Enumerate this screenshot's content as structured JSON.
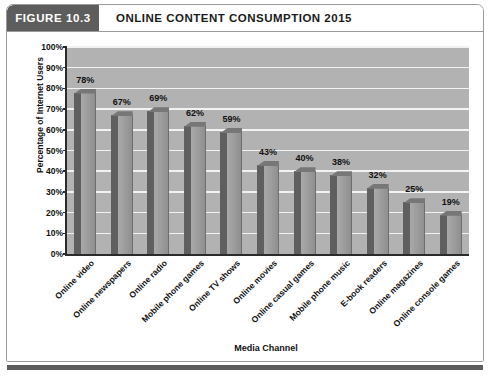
{
  "figure": {
    "badge": "FIGURE 10.3",
    "title": "ONLINE CONTENT CONSUMPTION 2015",
    "badge_color": "#5d5d5d",
    "frame_border_color": "#9a9a9a",
    "plot_background": "#b2b2b2",
    "bar_front_color": "#9e9e9e",
    "bar_side_color": "#5f5f5f",
    "gridline_color": "#f2f2f2",
    "axis_color": "#2b2b2b"
  },
  "chart_data": {
    "type": "bar",
    "title": "ONLINE CONTENT CONSUMPTION 2015",
    "xlabel": "Media Channel",
    "ylabel": "Percentage of Internet Users",
    "ylim": [
      0,
      100
    ],
    "ytick_labels": [
      "100%",
      "90%",
      "80%",
      "70%",
      "60%",
      "50%",
      "40%",
      "30%",
      "20%",
      "10%",
      "0%"
    ],
    "yticks": [
      100,
      90,
      80,
      70,
      60,
      50,
      40,
      30,
      20,
      10,
      0
    ],
    "grid": true,
    "legend": null,
    "categories": [
      "Online video",
      "Online newspapers",
      "Online radio",
      "Mobile phone games",
      "Online TV shows",
      "Online movies",
      "Online casual games",
      "Mobile phone music",
      "E-book readers",
      "Online magazines",
      "Online console games"
    ],
    "values": [
      78,
      67,
      69,
      62,
      59,
      43,
      40,
      38,
      32,
      25,
      19
    ],
    "value_labels": [
      "78%",
      "67%",
      "69%",
      "62%",
      "59%",
      "43%",
      "40%",
      "38%",
      "32%",
      "25%",
      "19%"
    ]
  }
}
